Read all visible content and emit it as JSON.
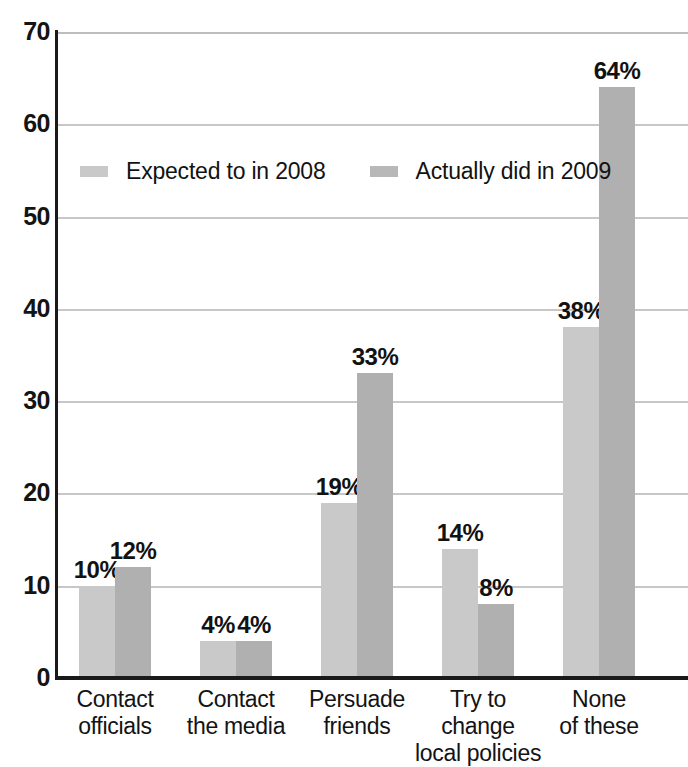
{
  "chart_data": {
    "type": "bar",
    "title": "",
    "subtitle": "",
    "xlabel": "",
    "ylabel": "",
    "ylim": [
      0,
      70
    ],
    "yticks": [
      0,
      10,
      20,
      30,
      40,
      50,
      60,
      70
    ],
    "ytick_labels": [
      "0",
      "10",
      "20",
      "30",
      "40",
      "50",
      "60",
      "70"
    ],
    "grid": true,
    "grid_axis": "y",
    "legend_position": "upper-left-inside",
    "value_suffix": "%",
    "categories": [
      "Contact officials",
      "Contact the media",
      "Persuade friends",
      "Try to change local policies",
      "None of these"
    ],
    "category_lines": [
      [
        "Contact",
        "officials"
      ],
      [
        "Contact",
        "the media"
      ],
      [
        "Persuade",
        "friends"
      ],
      [
        "Try to change",
        "local policies"
      ],
      [
        "None",
        "of these"
      ]
    ],
    "series": [
      {
        "name": "Expected to in 2008",
        "color": "#c9c9c9",
        "values": [
          10,
          4,
          19,
          14,
          38
        ],
        "labels": [
          "10%",
          "4%",
          "19%",
          "14%",
          "38%"
        ]
      },
      {
        "name": "Actually did in 2009",
        "color": "#b0b0b0",
        "values": [
          12,
          4,
          33,
          8,
          64
        ],
        "labels": [
          "12%",
          "4%",
          "33%",
          "8%",
          "64%"
        ]
      }
    ]
  },
  "legend": {
    "items": [
      {
        "label": "Expected to in 2008",
        "swatch": "s0"
      },
      {
        "label": "Actually did in 2009",
        "swatch": "s1"
      }
    ]
  },
  "colors": {
    "series_expected": "#c9c9c9",
    "series_actual": "#b0b0b0",
    "axis": "#1a1a1a",
    "gridline": "#c4c4c4",
    "text": "#121212",
    "background": "#ffffff"
  }
}
